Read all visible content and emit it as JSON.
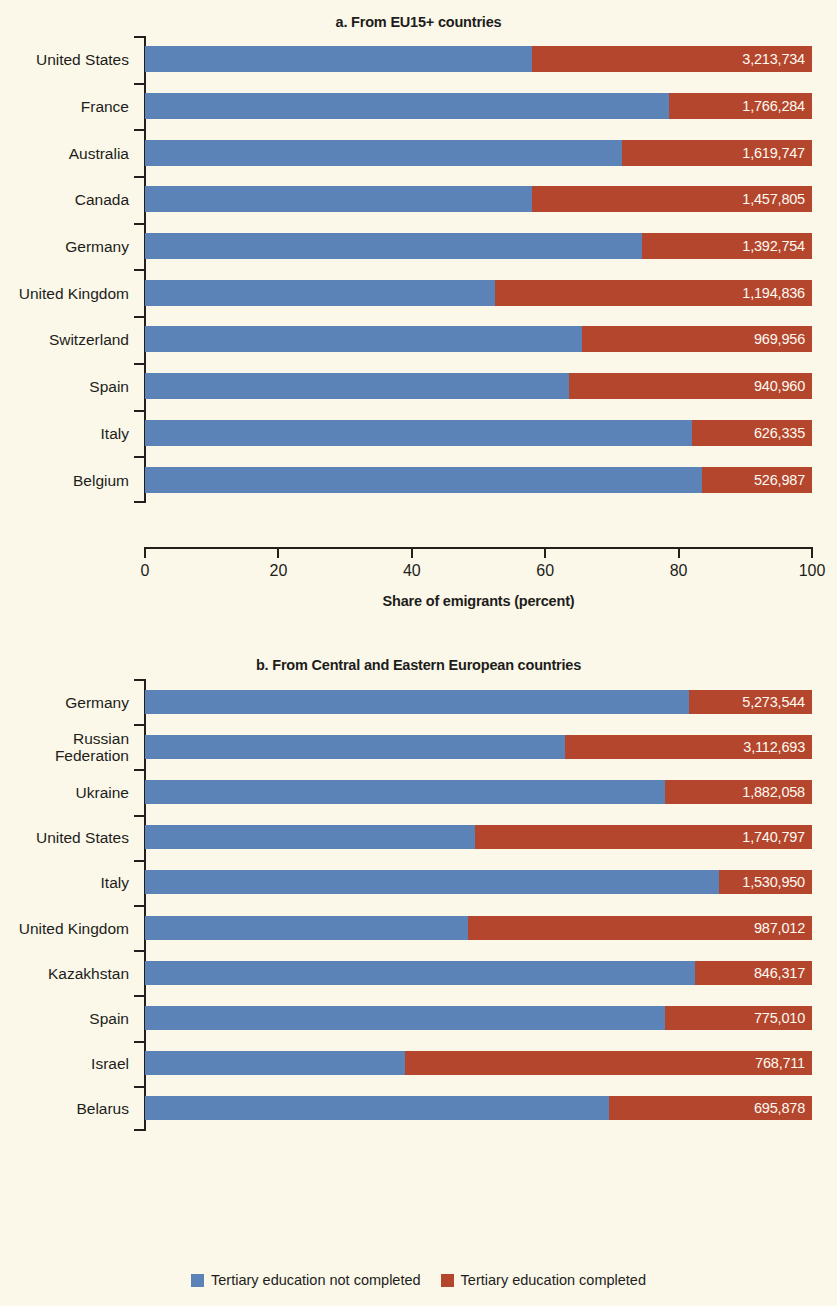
{
  "figure": {
    "background_color": "#fbf8e9",
    "series_colors": {
      "not_completed": "#5b83b7",
      "completed": "#b5462e"
    }
  },
  "legend": {
    "items": [
      {
        "label": "Tertiary education not completed",
        "color": "#5b83b7"
      },
      {
        "label": "Tertiary education completed",
        "color": "#b5462e"
      }
    ]
  },
  "panel_a": {
    "title": "a. From EU15+ countries",
    "xlabel": "Share of emigrants (percent)",
    "xticks": [
      "0",
      "20",
      "40",
      "60",
      "80",
      "100"
    ]
  },
  "panel_b": {
    "title": "b. From Central and Eastern European countries",
    "xlabel": "Share of emigrants (percent)",
    "xticks": [
      "0",
      "20",
      "40",
      "60",
      "80",
      "100"
    ]
  },
  "chart_data": [
    {
      "type": "bar",
      "orientation": "horizontal",
      "stacked": true,
      "normalized": true,
      "title": "a. From EU15+ countries",
      "xlabel": "Share of emigrants (percent)",
      "ylabel": "",
      "xlim": [
        0,
        100
      ],
      "xticks": [
        0,
        20,
        40,
        60,
        80,
        100
      ],
      "grid": false,
      "legend_position": "bottom",
      "categories": [
        "United States",
        "France",
        "Australia",
        "Canada",
        "Germany",
        "United Kingdom",
        "Switzerland",
        "Spain",
        "Italy",
        "Belgium"
      ],
      "series": [
        {
          "name": "Tertiary education not completed",
          "color": "#5b83b7",
          "values": [
            58.0,
            78.5,
            71.5,
            58.0,
            74.5,
            52.5,
            65.5,
            63.5,
            82.0,
            83.5
          ]
        },
        {
          "name": "Tertiary education completed",
          "color": "#b5462e",
          "values": [
            42.0,
            21.5,
            28.5,
            42.0,
            25.5,
            47.5,
            34.5,
            36.5,
            18.0,
            16.5
          ]
        }
      ],
      "data_labels": [
        "3,213,734",
        "1,766,284",
        "1,619,747",
        "1,457,805",
        "1,392,754",
        "1,194,836",
        "969,956",
        "940,960",
        "626,335",
        "526,987"
      ]
    },
    {
      "type": "bar",
      "orientation": "horizontal",
      "stacked": true,
      "normalized": true,
      "title": "b. From Central and Eastern European countries",
      "xlabel": "Share of emigrants (percent)",
      "ylabel": "",
      "xlim": [
        0,
        100
      ],
      "xticks": [
        0,
        20,
        40,
        60,
        80,
        100
      ],
      "grid": false,
      "legend_position": "bottom",
      "categories": [
        "Germany",
        "Russian\nFederation",
        "Ukraine",
        "United States",
        "Italy",
        "United Kingdom",
        "Kazakhstan",
        "Spain",
        "Israel",
        "Belarus"
      ],
      "series": [
        {
          "name": "Tertiary education not completed",
          "color": "#5b83b7",
          "values": [
            81.5,
            63.0,
            78.0,
            49.5,
            86.0,
            48.5,
            82.5,
            78.0,
            39.0,
            69.5
          ]
        },
        {
          "name": "Tertiary education completed",
          "color": "#b5462e",
          "values": [
            18.5,
            37.0,
            22.0,
            50.5,
            14.0,
            51.5,
            17.5,
            22.0,
            61.0,
            30.5
          ]
        }
      ],
      "data_labels": [
        "5,273,544",
        "3,112,693",
        "1,882,058",
        "1,740,797",
        "1,530,950",
        "987,012",
        "846,317",
        "775,010",
        "768,711",
        "695,878"
      ]
    }
  ]
}
